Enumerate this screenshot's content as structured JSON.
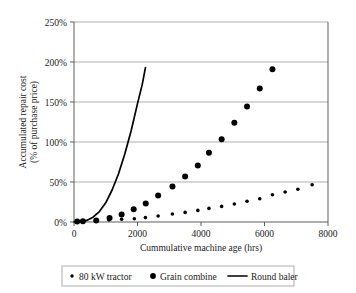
{
  "chart_data": {
    "type": "scatter",
    "title": "",
    "subtitle": "",
    "xlabel": "Cummulative machine age (hrs)",
    "ylabel": "Accumulated repair cost\n(% of purchase price)",
    "ylabel_line1": "Accumulated repair cost",
    "ylabel_line2": "(% of purchase price)",
    "xlim": [
      0,
      8000
    ],
    "ylim": [
      0,
      250
    ],
    "xticks": [
      0,
      2000,
      4000,
      6000,
      8000
    ],
    "xtick_labels": [
      "0",
      "2000",
      "4000",
      "6000",
      "8000"
    ],
    "yticks": [
      0,
      50,
      100,
      150,
      200,
      250
    ],
    "ytick_labels": [
      "0%",
      "50%",
      "100%",
      "150%",
      "200%",
      "250%"
    ],
    "grid": "horizontal",
    "legend_position": "below",
    "series": [
      {
        "name": "80 kW tractor",
        "marker": "small-dot",
        "render": "points",
        "x": [
          100,
          250,
          700,
          1100,
          1500,
          1900,
          2250,
          2650,
          3100,
          3500,
          3900,
          4250,
          4650,
          5050,
          5450,
          5850,
          6250,
          6650,
          7050,
          7500
        ],
        "y": [
          0.5,
          1,
          1.5,
          2.5,
          3.5,
          4,
          5.5,
          7.5,
          10,
          12,
          14.5,
          17,
          19.5,
          22.5,
          26,
          29,
          34,
          37.5,
          41,
          46.5
        ]
      },
      {
        "name": "Grain combine",
        "marker": "large-dot",
        "render": "points",
        "x": [
          100,
          280,
          700,
          1120,
          1500,
          1880,
          2260,
          2650,
          3100,
          3500,
          3900,
          4250,
          4650,
          5050,
          5450,
          5850,
          6250
        ],
        "y": [
          0.5,
          1,
          2,
          5,
          9.5,
          16,
          23,
          33,
          44.5,
          57,
          70.5,
          86.5,
          103.5,
          124,
          144.5,
          167,
          191
        ]
      },
      {
        "name": "Round baler",
        "marker": "line",
        "render": "line",
        "x": [
          0,
          200,
          400,
          600,
          800,
          1000,
          1200,
          1400,
          1600,
          1800,
          2000,
          2150,
          2250
        ],
        "y": [
          0,
          0.5,
          2,
          6,
          13,
          24,
          40,
          60,
          85,
          114,
          148,
          172,
          193
        ]
      }
    ],
    "colors": {
      "marker": "#000000",
      "line": "#000000",
      "grid": "#8c8c8c",
      "axis": "#4d4d4d",
      "background": "#ffffff",
      "text": "#1a1a1a"
    }
  },
  "legend": {
    "items": [
      {
        "label": "80 kW tractor",
        "glyph": "small-dot-glyph"
      },
      {
        "label": "Grain combine",
        "glyph": "large-dot-glyph"
      },
      {
        "label": "Round baler",
        "glyph": "line-glyph"
      }
    ]
  }
}
